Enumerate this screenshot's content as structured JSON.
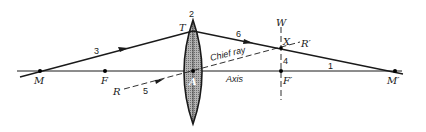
{
  "diagram": {
    "labels": {
      "M": "M",
      "F": "F",
      "A": "A",
      "T": "T",
      "R": "R",
      "W": "W",
      "X": "X",
      "R_prime": "R′",
      "F_prime": "F′",
      "M_prime": "M′",
      "chief_ray": "Chief ray",
      "axis": "Axis"
    },
    "ray_numbers": {
      "n1": "1",
      "n2": "2",
      "n3": "3",
      "n4": "4",
      "n5": "5",
      "n6": "6"
    },
    "colors": {
      "stroke": "#1a1a1a",
      "lens_fill": "#9a9a9a",
      "background": "#ffffff"
    }
  }
}
